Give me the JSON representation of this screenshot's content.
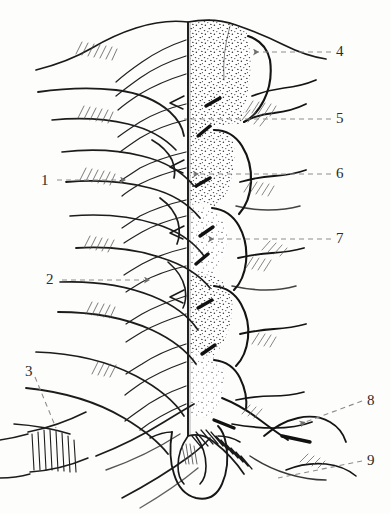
{
  "figure": {
    "type": "scientific-line-drawing",
    "background_color": "#fdfdfc",
    "ink_color": "#1e1e1e",
    "leader_color": "#8d8d8d",
    "width": 390,
    "height": 514,
    "midline_x": 188,
    "halves": {
      "left_label": "outline half",
      "right_label": "stippled half"
    }
  },
  "labels": [
    {
      "id": "1",
      "text": "1",
      "text_x": 41,
      "text_y": 173,
      "leader": {
        "x1": 57,
        "y1": 180,
        "x2": 120,
        "y2": 180
      },
      "arrow": true,
      "arrow_dir": "right"
    },
    {
      "id": "2",
      "text": "2",
      "text_x": 46,
      "text_y": 272,
      "leader": {
        "x1": 62,
        "y1": 280,
        "x2": 144,
        "y2": 280
      },
      "arrow": true,
      "arrow_dir": "right"
    },
    {
      "id": "3",
      "text": "3",
      "text_x": 25,
      "text_y": 364,
      "leader": {
        "x1": 35,
        "y1": 377,
        "x2": 56,
        "y2": 428
      },
      "arrow": false,
      "arrow_dir": "down-right"
    },
    {
      "id": "4",
      "text": "4",
      "text_x": 336,
      "text_y": 44,
      "leader": {
        "x1": 331,
        "y1": 52,
        "x2": 253,
        "y2": 52
      },
      "arrow": true,
      "arrow_dir": "left"
    },
    {
      "id": "5",
      "text": "5",
      "text_x": 336,
      "text_y": 111,
      "leader": {
        "x1": 331,
        "y1": 119,
        "x2": 184,
        "y2": 119
      },
      "arrow": false,
      "arrow_dir": "left"
    },
    {
      "id": "6",
      "text": "6",
      "text_x": 336,
      "text_y": 166,
      "leader": {
        "x1": 331,
        "y1": 174,
        "x2": 193,
        "y2": 174
      },
      "arrow": true,
      "arrow_dir": "left"
    },
    {
      "id": "7",
      "text": "7",
      "text_x": 336,
      "text_y": 231,
      "leader": {
        "x1": 331,
        "y1": 239,
        "x2": 208,
        "y2": 239
      },
      "arrow": true,
      "arrow_dir": "left"
    },
    {
      "id": "8",
      "text": "8",
      "text_x": 367,
      "text_y": 393,
      "leader": {
        "x1": 362,
        "y1": 401,
        "x2": 300,
        "y2": 424
      },
      "arrow": true,
      "arrow_dir": "left-down"
    },
    {
      "id": "9",
      "text": "9",
      "text_x": 367,
      "text_y": 453,
      "leader": {
        "x1": 362,
        "y1": 461,
        "x2": 278,
        "y2": 478
      },
      "arrow": false,
      "arrow_dir": "left-down"
    }
  ]
}
